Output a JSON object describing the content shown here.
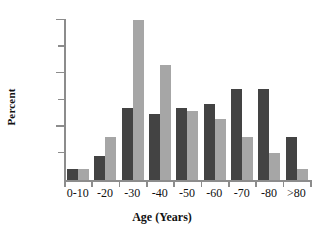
{
  "chart_data": {
    "type": "bar",
    "title": "",
    "xlabel": "Age (Years)",
    "ylabel": "Percent",
    "categories": [
      "0-10",
      "-20",
      "-30",
      "-40",
      "-50",
      "-60",
      "-70",
      "-80",
      ">80"
    ],
    "series": [
      {
        "name": "dark",
        "color": "#434343",
        "values": [
          2,
          4.5,
          13.5,
          12.3,
          13.5,
          14.3,
          17,
          17,
          8
        ]
      },
      {
        "name": "light",
        "color": "#a6a6a6",
        "values": [
          2,
          8,
          30,
          21.5,
          13,
          11.5,
          8,
          5,
          2
        ]
      }
    ],
    "ylim": [
      0,
      30
    ],
    "yticks": [
      0,
      5,
      10,
      15,
      20,
      25,
      30
    ],
    "ytick_labels": [
      "",
      "",
      "10",
      "",
      "20",
      "",
      "30"
    ],
    "grid": false,
    "legend": "none"
  },
  "axis": {
    "y_title": "Percent",
    "x_title": "Age (Years)",
    "y_labels": [
      "10",
      "20",
      "30"
    ]
  }
}
